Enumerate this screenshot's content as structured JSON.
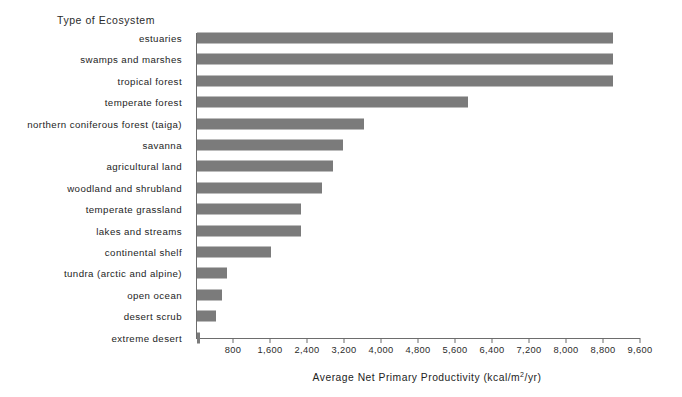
{
  "chart_data": {
    "type": "bar",
    "orientation": "horizontal",
    "title": "",
    "category_axis_heading": "Type of Ecosystem",
    "xlabel": "Average Net Primary Productivity (kcal/m²/yr)",
    "ylabel": "",
    "xlim": [
      0,
      9600
    ],
    "xticks": [
      800,
      1600,
      2400,
      3200,
      4000,
      4800,
      5600,
      6400,
      7200,
      8000,
      8800,
      9600
    ],
    "xtick_labels": [
      "800",
      "1,600",
      "2,400",
      "3,200",
      "4,000",
      "4,800",
      "5,600",
      "6,400",
      "7,200",
      "8,000",
      "8,800",
      "9,600"
    ],
    "grid": false,
    "legend": false,
    "bar_color": "#7b7b7b",
    "axis_color": "#6d6d6d",
    "categories": [
      "estuaries",
      "swamps and marshes",
      "tropical forest",
      "temperate forest",
      "northern coniferous forest (taiga)",
      "savanna",
      "agricultural land",
      "woodland and shrubland",
      "temperate grassland",
      "lakes and streams",
      "continental shelf",
      "tundra (arctic and alpine)",
      "open ocean",
      "desert scrub",
      "extreme desert"
    ],
    "values": [
      9000,
      9000,
      9000,
      5850,
      3600,
      3150,
      2950,
      2700,
      2250,
      2250,
      1600,
      650,
      550,
      400,
      70
    ]
  },
  "x_axis_title": {
    "prefix": "Average Net Primary Productivity (kcal/m",
    "exponent": "2",
    "suffix": "/yr)"
  }
}
